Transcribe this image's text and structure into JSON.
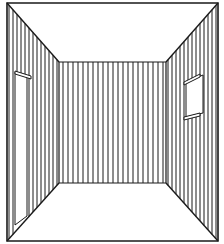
{
  "diagram": {
    "title": "",
    "colors": {
      "background": "#ffffff",
      "stroke": "#1a1a1a"
    },
    "frame": {
      "x": 7,
      "y": 3,
      "w": 211,
      "h": 238
    },
    "back_wall": {
      "x1": 59,
      "y1": 62,
      "x2": 166,
      "y2": 183
    },
    "stripes": {
      "back_spacing": 5,
      "side_spacing": 4
    },
    "elements": [
      {
        "name": "ceiling",
        "label": ""
      },
      {
        "name": "floor",
        "label": ""
      },
      {
        "name": "back-wall",
        "label": ""
      },
      {
        "name": "left-wall",
        "label": ""
      },
      {
        "name": "right-wall",
        "label": ""
      },
      {
        "name": "door",
        "label": ""
      },
      {
        "name": "window",
        "label": ""
      }
    ]
  }
}
